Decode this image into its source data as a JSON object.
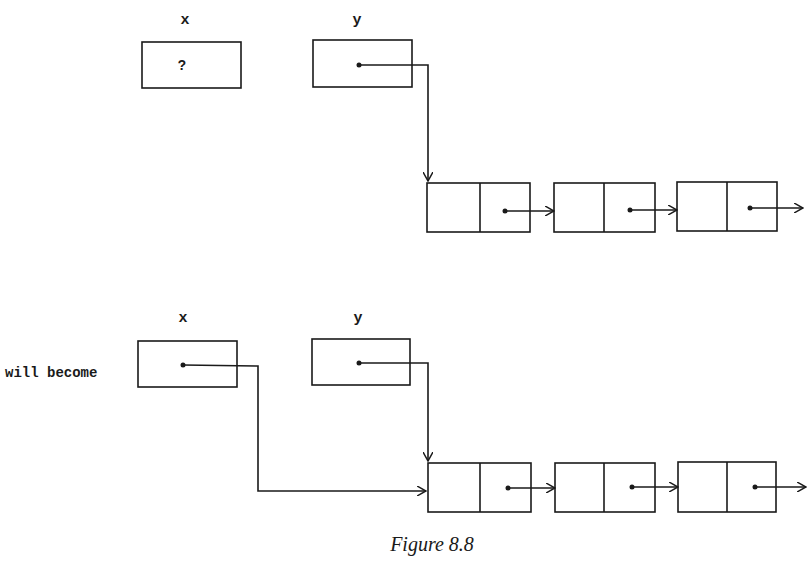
{
  "diagram": {
    "caption": "Figure 8.8",
    "transition_label": "will become",
    "before": {
      "variables": [
        {
          "name": "x",
          "value": "?"
        },
        {
          "name": "y",
          "value": ""
        }
      ],
      "list_nodes": 3
    },
    "after": {
      "variables": [
        {
          "name": "x",
          "value": ""
        },
        {
          "name": "y",
          "value": ""
        }
      ],
      "list_nodes": 3
    }
  }
}
